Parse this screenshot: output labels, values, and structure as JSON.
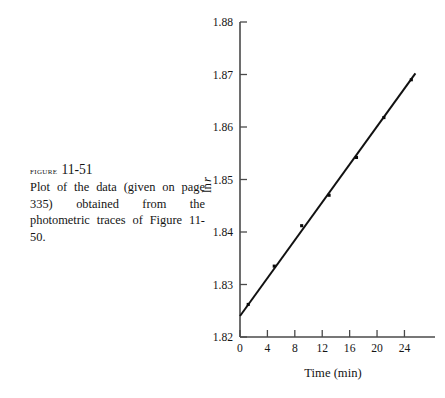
{
  "figure": {
    "label": "figure",
    "number": "11-51",
    "caption": "Plot of the data (given on page 335) obtained from the photometric traces of Figure 11-50."
  },
  "chart_data": {
    "type": "scatter",
    "title": "",
    "xlabel": "Time (min)",
    "ylabel": "ln r",
    "xlim": [
      0,
      27
    ],
    "ylim": [
      1.82,
      1.88
    ],
    "xticks": [
      0,
      4,
      8,
      12,
      16,
      20,
      24
    ],
    "xticklabels": [
      "0",
      "4",
      "8",
      "12",
      "16",
      "20",
      "24"
    ],
    "yticks": [
      1.82,
      1.83,
      1.84,
      1.85,
      1.86,
      1.87,
      1.88
    ],
    "yticklabels": [
      "1.82",
      "1.83",
      "1.84",
      "1.85",
      "1.86",
      "1.87",
      "1.88"
    ],
    "grid": false,
    "legend": null,
    "marker": "filled-square",
    "x": [
      1.2,
      5.0,
      9.0,
      13.0,
      17.0,
      21.0,
      25.0
    ],
    "y": [
      1.8262,
      1.8335,
      1.8412,
      1.847,
      1.8542,
      1.8618,
      1.869
    ],
    "fit_line": {
      "x": [
        0.0,
        25.6
      ],
      "y": [
        1.824,
        1.8702
      ]
    },
    "colors": {
      "line": "#111111",
      "marker": "#0a0a0a",
      "axis": "#4a4a4a",
      "text": "#141414",
      "background": "#ffffff"
    }
  }
}
